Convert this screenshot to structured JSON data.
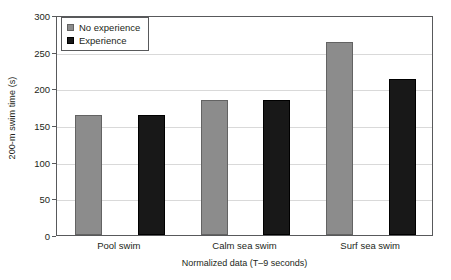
{
  "chart_data": {
    "type": "bar",
    "title": "",
    "xlabel": "Normalized data (T–9 seconds)",
    "ylabel": "200-m swim time (s)",
    "categories": [
      "Pool swim",
      "Calm sea swim",
      "Surf sea swim"
    ],
    "series": [
      {
        "name": "No experience",
        "color": "#8c8c8c",
        "values": [
          164,
          184,
          263
        ]
      },
      {
        "name": "Experience",
        "color": "#181818",
        "values": [
          164,
          184,
          213
        ]
      }
    ],
    "ylim": [
      0,
      300
    ],
    "yticks": [
      0,
      50,
      100,
      150,
      200,
      250,
      300
    ],
    "ytick_labels": [
      "0",
      "50",
      "100",
      "150",
      "200",
      "250",
      "300"
    ],
    "grid": true,
    "legend_position": "top-left",
    "legend_entries": [
      {
        "label": "No experience",
        "swatch": "gray"
      },
      {
        "label": "Experience",
        "swatch": "black"
      }
    ]
  }
}
